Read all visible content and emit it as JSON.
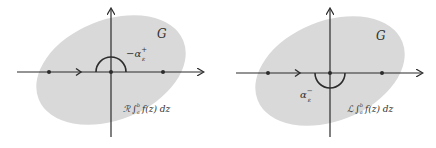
{
  "colors": {
    "region_fill": "#d9d9d9",
    "line": "#2b2b2b",
    "text": "#333333",
    "background": "#ffffff"
  },
  "panels": [
    {
      "id": "left",
      "region_label": "G",
      "arc_label": "−α",
      "arc_label_sup": "+",
      "arc_label_sub": "ε",
      "arc_direction": "upper-semicircle",
      "integral_prefix": "ℛ",
      "integral_text": "∫",
      "integral_lower": "a",
      "integral_upper": "b",
      "integral_body": "f(z) dz"
    },
    {
      "id": "right",
      "region_label": "G",
      "arc_label": "α",
      "arc_label_sup": "−",
      "arc_label_sub": "ε",
      "arc_direction": "lower-semicircle",
      "integral_prefix": "ℒ",
      "integral_text": "∫",
      "integral_lower": "a",
      "integral_upper": "b",
      "integral_body": "f(z) dz"
    }
  ]
}
